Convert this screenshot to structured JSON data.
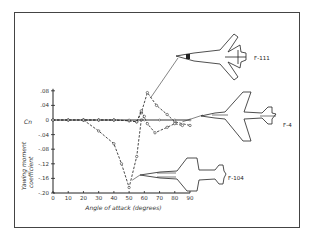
{
  "chart_data": {
    "type": "line",
    "title": "",
    "xlabel": "Angle of attack (degrees)",
    "ylabel": "Yawing moment coefficient",
    "ysymbol": "Cn",
    "xlim": [
      0,
      90
    ],
    "ylim": [
      -0.2,
      0.08
    ],
    "x_ticks": [
      "0",
      "10",
      "20",
      "30",
      "40",
      "50",
      "60",
      "70",
      "80",
      "90"
    ],
    "y_ticks": [
      ".08",
      ".04",
      "0",
      "-.04",
      "-.08",
      "-.12",
      "-.16",
      "-.20"
    ],
    "grid": false,
    "legend": "aircraft silhouettes with leader lines pointing to curves",
    "series": [
      {
        "name": "F-111",
        "x": [
          0,
          10,
          20,
          30,
          40,
          50,
          55,
          58,
          62,
          68,
          75,
          80,
          90
        ],
        "y": [
          0,
          0,
          0,
          0,
          0,
          -0.002,
          -0.005,
          0.02,
          0.075,
          0.04,
          0.015,
          -0.005,
          -0.015
        ]
      },
      {
        "name": "F-4",
        "x": [
          0,
          10,
          20,
          30,
          40,
          50,
          55,
          58,
          62,
          67,
          75,
          80,
          85
        ],
        "y": [
          0,
          0,
          0,
          0,
          0,
          -0.002,
          -0.005,
          0.025,
          -0.01,
          -0.035,
          -0.02,
          -0.01,
          -0.015
        ]
      },
      {
        "name": "F-104",
        "x": [
          20,
          30,
          40,
          45,
          50,
          55,
          58,
          60
        ],
        "y": [
          0,
          -0.03,
          -0.065,
          -0.12,
          -0.185,
          -0.1,
          0.0,
          0.01
        ]
      },
      {
        "name": "baseline",
        "x": [
          0,
          10,
          20,
          30,
          40,
          50,
          60,
          70,
          80,
          90
        ],
        "y": [
          0,
          0,
          0,
          0,
          0,
          0,
          0,
          0,
          0,
          0
        ]
      }
    ]
  },
  "labels": {
    "f111": "F-111",
    "f4": "F-4",
    "f104": "F-104",
    "xlabel": "Angle of attack (degrees)",
    "ylabel_line1": "Yawing moment",
    "ylabel_line2": "coefficient",
    "cn": "Cn"
  }
}
